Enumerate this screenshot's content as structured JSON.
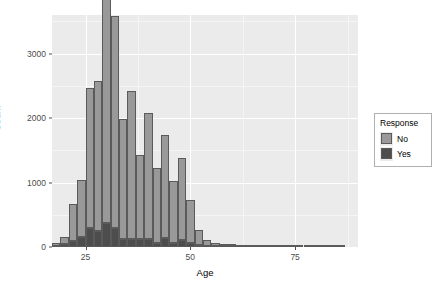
{
  "chart_data": {
    "type": "bar",
    "title": "",
    "subtitle": "",
    "xlabel": "Age",
    "ylabel": "Count",
    "xlim": [
      17,
      90
    ],
    "ylim": [
      0,
      3600
    ],
    "xticks": [
      25,
      50,
      75
    ],
    "xtick_labels": [
      "25",
      "50",
      "75"
    ],
    "yticks": [
      0,
      1000,
      2000,
      3000
    ],
    "ytick_labels": [
      "0",
      "1000",
      "2000",
      "3000"
    ],
    "grid": true,
    "stacked": true,
    "bin_width": 2,
    "legend": {
      "title": "Response",
      "position": "right",
      "entries": [
        {
          "label": "No",
          "color": "#999999"
        },
        {
          "label": "Yes",
          "color": "#4d4d4d"
        }
      ]
    },
    "categories": [
      18,
      20,
      22,
      24,
      26,
      28,
      30,
      32,
      34,
      36,
      38,
      40,
      42,
      44,
      46,
      48,
      50,
      52,
      54,
      56,
      58,
      60,
      62,
      64,
      66,
      68,
      70,
      72,
      74,
      76,
      78,
      80,
      82,
      84,
      86
    ],
    "series": [
      {
        "name": "No",
        "color": "#999999",
        "values": [
          40,
          110,
          570,
          890,
          2170,
          2320,
          3530,
          3280,
          1860,
          2290,
          1310,
          1960,
          1160,
          1600,
          960,
          1270,
          670,
          230,
          90,
          45,
          40,
          35,
          25,
          20,
          15,
          12,
          10,
          8,
          5,
          4,
          3,
          2,
          2,
          1,
          1
        ]
      },
      {
        "name": "Yes",
        "color": "#4d4d4d",
        "values": [
          20,
          45,
          90,
          150,
          300,
          250,
          370,
          300,
          120,
          130,
          120,
          120,
          60,
          140,
          60,
          110,
          60,
          30,
          20,
          12,
          10,
          8,
          8,
          6,
          5,
          4,
          4,
          3,
          2,
          2,
          2,
          1,
          1,
          1,
          1
        ]
      }
    ]
  },
  "axis": {
    "x_title": "Age",
    "y_title": "Count"
  }
}
